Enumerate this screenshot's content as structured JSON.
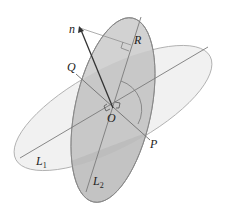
{
  "diagram": {
    "labels": {
      "n": "n",
      "R": "R",
      "Q": "Q",
      "O": "O",
      "P": "P",
      "L1_main": "L",
      "L1_sub": "1",
      "L2_main": "L",
      "L2_sub": "2"
    },
    "colors": {
      "background": "#ffffff",
      "plane1_fill": "#efefef",
      "plane2_fill": "#c8c8c8",
      "overlap_fill": "#b4b4b4",
      "lower_fill": "#a9a9a9",
      "line_color": "#7a7a7a",
      "vector_color": "#333333"
    },
    "points": {
      "O": [
        113,
        111
      ],
      "n_tip": [
        80,
        28
      ],
      "R": [
        137,
        43
      ],
      "Q": [
        76,
        73
      ],
      "P": [
        149,
        139
      ]
    }
  }
}
